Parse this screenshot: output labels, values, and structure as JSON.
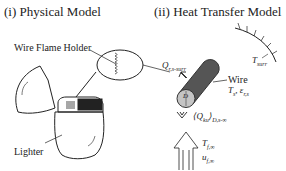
{
  "panels": [
    {
      "id": "physical",
      "title": "(i) Physical Model",
      "labels": {
        "flame_holder": "Wire Flame Holder",
        "lighter": "Lighter"
      }
    },
    {
      "id": "heat",
      "title": "(ii) Heat Transfer Model",
      "labels": {
        "wire": "Wire",
        "T_surr": "T",
        "T_surr_sub": "surr",
        "Q_rad": "Q",
        "Q_rad_sub": "r,s-surr",
        "wire_props": "T",
        "wire_props_sub": "s",
        "eps": ", ε",
        "eps_sub": "r,s",
        "diameter": "D",
        "Q_ku": "⟨Q",
        "Q_ku_sub1": "ku",
        "Q_ku_close": "⟩",
        "Q_ku_sub2": "D,s-∞",
        "T_inf": "T",
        "T_inf_sub": "f,∞",
        "u_inf": "u",
        "u_inf_sub": "f,∞"
      }
    }
  ],
  "colors": {
    "line": "#222222",
    "wire_fill": "#555555",
    "wire_end": "#bdbdbd"
  }
}
